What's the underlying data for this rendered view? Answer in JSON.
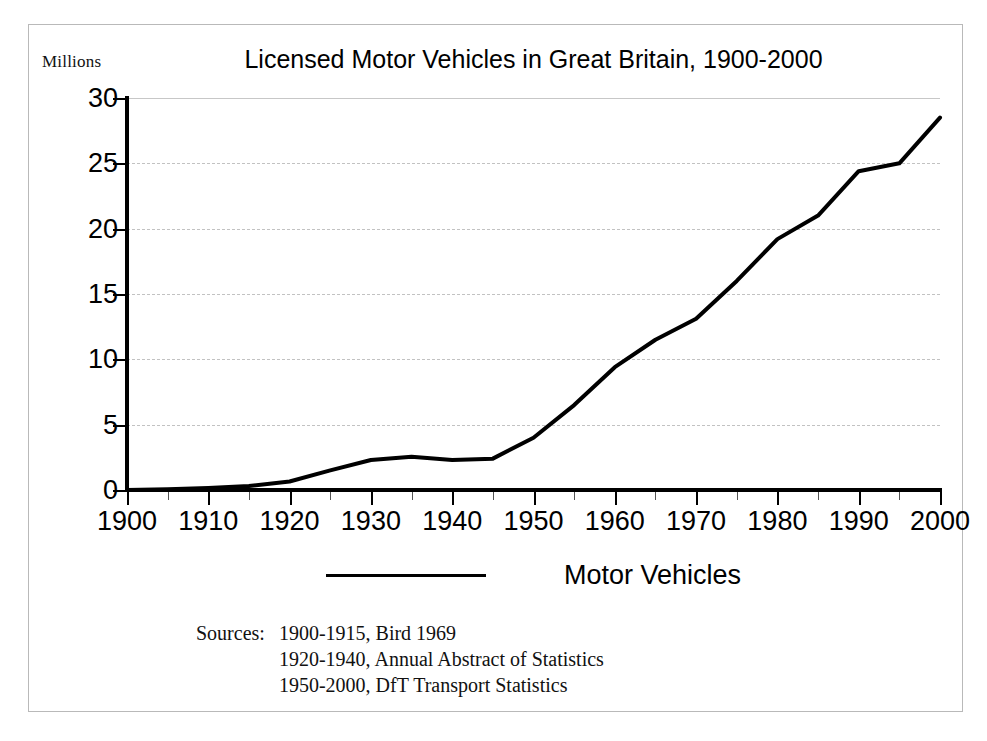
{
  "chart_data": {
    "type": "line",
    "title": "Licensed Motor Vehicles in Great Britain, 1900-2000",
    "xlabel": "",
    "ylabel": "Millions",
    "unit_label": "Millions",
    "xlim": [
      1900,
      2000
    ],
    "ylim": [
      0,
      30
    ],
    "grid": true,
    "legend_position": "bottom",
    "x_major_ticks": [
      1900,
      1910,
      1920,
      1930,
      1940,
      1950,
      1960,
      1970,
      1980,
      1990,
      2000
    ],
    "x_minor_ticks": [
      1905,
      1915,
      1925,
      1935,
      1945,
      1955,
      1965,
      1975,
      1985,
      1995
    ],
    "x_tick_labels": [
      "1900",
      "1910",
      "1920",
      "1930",
      "1940",
      "1950",
      "1960",
      "1970",
      "1980",
      "1990",
      "2000"
    ],
    "y_ticks": [
      0,
      5,
      10,
      15,
      20,
      25,
      30
    ],
    "y_tick_labels": [
      "0",
      "5",
      "10",
      "15",
      "20",
      "25",
      "30"
    ],
    "series": [
      {
        "name": "Motor Vehicles",
        "color": "#000000",
        "x": [
          1900,
          1905,
          1910,
          1915,
          1920,
          1925,
          1930,
          1935,
          1940,
          1945,
          1950,
          1955,
          1960,
          1965,
          1970,
          1975,
          1980,
          1985,
          1990,
          1995,
          2000
        ],
        "values": [
          0.0,
          0.05,
          0.15,
          0.3,
          0.65,
          1.5,
          2.3,
          2.55,
          2.3,
          2.4,
          4.0,
          6.5,
          9.4,
          11.5,
          13.1,
          16.0,
          19.2,
          21.0,
          24.4,
          25.0,
          28.5
        ]
      }
    ],
    "legend": [
      {
        "label": "Motor Vehicles",
        "marker": "line",
        "color": "#000000"
      }
    ]
  },
  "sources": {
    "label": "Sources:",
    "lines": [
      "1900-1915, Bird 1969",
      "1920-1940, Annual Abstract of Statistics",
      "1950-2000, DfT Transport Statistics"
    ]
  },
  "colors": {
    "series": "#000000",
    "gridline": "#c7c7c7",
    "axis": "#000000",
    "border": "#b9b9b9",
    "background": "#ffffff"
  }
}
